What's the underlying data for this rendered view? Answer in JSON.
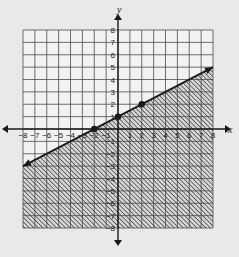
{
  "chart_data": {
    "type": "line",
    "title": "",
    "xlabel": "x",
    "ylabel": "y",
    "xlim": [
      -8,
      8
    ],
    "ylim": [
      -8,
      8
    ],
    "grid": true,
    "x_ticks": [
      -8,
      -7,
      -6,
      -5,
      -4,
      -3,
      -2,
      -1,
      1,
      2,
      3,
      4,
      5,
      6,
      7,
      8
    ],
    "y_ticks": [
      -8,
      -7,
      -6,
      -5,
      -4,
      -3,
      -2,
      -1,
      1,
      2,
      3,
      4,
      5,
      6,
      7,
      8
    ],
    "series": [
      {
        "name": "boundary line",
        "equation": "y = 1/2 x + 1",
        "line_style": "solid",
        "arrows_both_ends": true,
        "x": [
          -8,
          8
        ],
        "y": [
          -3,
          5
        ]
      }
    ],
    "points": [
      {
        "x": -2,
        "y": 0
      },
      {
        "x": 0,
        "y": 1
      },
      {
        "x": 2,
        "y": 2
      }
    ],
    "shaded_region": {
      "inequality": "y <= 1/2 x + 1",
      "side": "below",
      "pattern": "diagonal-hatch"
    }
  },
  "colors": {
    "background": "#e9e9e9",
    "grid_fill": "#f2f2f2",
    "grid_line": "#4a4a4a",
    "ink": "#1a1a1a",
    "hatch": "#333333"
  }
}
